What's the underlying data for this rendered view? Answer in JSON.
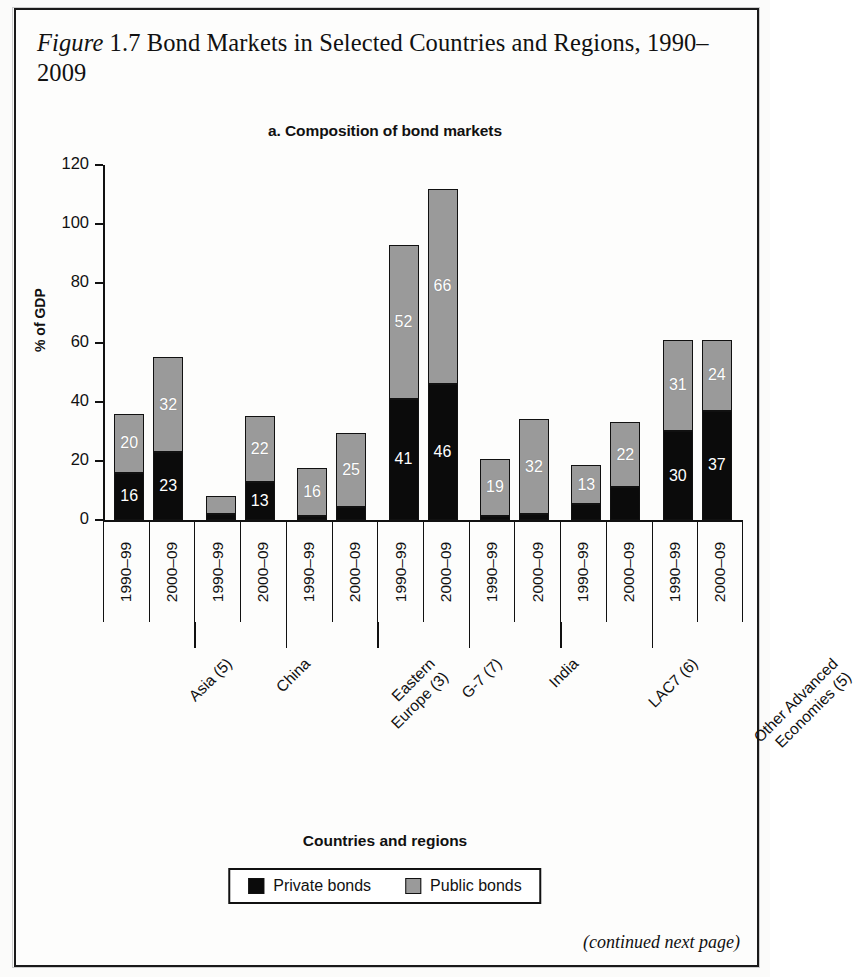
{
  "figure": {
    "label": "Figure 1.7",
    "title": "Bond Markets in Selected Countries and Regions, 1990–2009",
    "title_line1_prefix": "Figure",
    "title_line1_num": " 1.7",
    "title_rest": " Bond Markets in Selected Countries and Regions, 1990–2009",
    "footer": "(continued next page)"
  },
  "panel": {
    "subtitle": "a. Composition of bond markets"
  },
  "legend": {
    "items": [
      {
        "label": "Private bonds",
        "color": "#0b0b0b",
        "key": "private"
      },
      {
        "label": "Public bonds",
        "color": "#9a9a9a",
        "key": "public"
      }
    ]
  },
  "chart_data": {
    "type": "bar",
    "subtype": "stacked-column",
    "title": "a. Composition of bond markets",
    "figure_title": "Figure 1.7 Bond Markets in Selected Countries and Regions, 1990–2009",
    "xlabel": "Countries and regions",
    "ylabel": "% of GDP",
    "ylim": [
      0,
      120
    ],
    "yticks": [
      0,
      20,
      40,
      60,
      80,
      100,
      120
    ],
    "ytick_labels": [
      "0",
      "20",
      "40",
      "60",
      "80",
      "100",
      "120"
    ],
    "grid": false,
    "legend_position": "bottom",
    "groups": [
      "Asia (5)",
      "China",
      "Eastern Europe (3)",
      "G-7 (7)",
      "India",
      "LAC7 (6)",
      "Other Advanced Economies (5)"
    ],
    "periods": [
      "1990–99",
      "2000–09"
    ],
    "categories": [
      "Asia (5) 1990–99",
      "Asia (5) 2000–09",
      "China 1990–99",
      "China 2000–09",
      "Eastern Europe (3) 1990–99",
      "Eastern Europe (3) 2000–09",
      "G-7 (7) 1990–99",
      "G-7 (7) 2000–09",
      "India 1990–99",
      "India 2000–09",
      "LAC7 (6) 1990–99",
      "LAC7 (6) 2000–09",
      "Other Advanced Economies (5) 1990–99",
      "Other Advanced Economies (5) 2000–09"
    ],
    "series": [
      {
        "name": "Private bonds",
        "color": "#0b0b0b",
        "values": [
          16,
          23,
          2,
          13,
          1.5,
          4.5,
          41,
          46,
          1.5,
          2,
          5.5,
          11,
          30,
          37
        ]
      },
      {
        "name": "Public bonds",
        "color": "#9a9a9a",
        "values": [
          20,
          32,
          6,
          22,
          16,
          25,
          52,
          66,
          19,
          32,
          13,
          22,
          31,
          24
        ]
      }
    ],
    "totals": [
      36,
      55,
      8,
      35,
      17.5,
      29.5,
      93,
      112,
      20.5,
      34,
      18.5,
      33,
      61,
      61
    ],
    "bars": [
      {
        "group": "Asia (5)",
        "period": "1990–99",
        "private": 16,
        "public": 20,
        "private_label": "16",
        "public_label": "20"
      },
      {
        "group": "Asia (5)",
        "period": "2000–09",
        "private": 23,
        "public": 32,
        "private_label": "23",
        "public_label": "32"
      },
      {
        "group": "China",
        "period": "1990–99",
        "private": 2,
        "public": 6,
        "private_label": "",
        "public_label": ""
      },
      {
        "group": "China",
        "period": "2000–09",
        "private": 13,
        "public": 22,
        "private_label": "13",
        "public_label": "22"
      },
      {
        "group": "Eastern Europe (3)",
        "period": "1990–99",
        "private": 1.5,
        "public": 16,
        "private_label": "",
        "public_label": "16"
      },
      {
        "group": "Eastern Europe (3)",
        "period": "2000–09",
        "private": 4.5,
        "public": 25,
        "private_label": "",
        "public_label": "25"
      },
      {
        "group": "G-7 (7)",
        "period": "1990–99",
        "private": 41,
        "public": 52,
        "private_label": "41",
        "public_label": "52"
      },
      {
        "group": "G-7 (7)",
        "period": "2000–09",
        "private": 46,
        "public": 66,
        "private_label": "46",
        "public_label": "66"
      },
      {
        "group": "India",
        "period": "1990–99",
        "private": 1.5,
        "public": 19,
        "private_label": "",
        "public_label": "19"
      },
      {
        "group": "India",
        "period": "2000–09",
        "private": 2,
        "public": 32,
        "private_label": "",
        "public_label": "32"
      },
      {
        "group": "LAC7 (6)",
        "period": "1990–99",
        "private": 5.5,
        "public": 13,
        "private_label": "",
        "public_label": "13"
      },
      {
        "group": "LAC7 (6)",
        "period": "2000–09",
        "private": 11,
        "public": 22,
        "private_label": "",
        "public_label": "22"
      },
      {
        "group": "Other Advanced Economies (5)",
        "period": "1990–99",
        "private": 30,
        "public": 31,
        "private_label": "30",
        "public_label": "31"
      },
      {
        "group": "Other Advanced Economies (5)",
        "period": "2000–09",
        "private": 37,
        "public": 24,
        "private_label": "37",
        "public_label": "24"
      }
    ]
  }
}
